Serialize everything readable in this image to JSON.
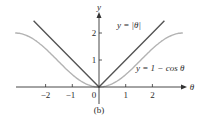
{
  "chart_data": {
    "type": "line",
    "title": "",
    "caption": "(b)",
    "xlabel": "θ",
    "ylabel": "y",
    "xlim": [
      -3.14,
      3.14
    ],
    "ylim": [
      0,
      2.4
    ],
    "x_ticks": [
      -2,
      -1,
      0,
      1,
      2
    ],
    "x_tick_labels": [
      "−2",
      "−1",
      "0",
      "1",
      "2"
    ],
    "y_ticks": [
      1,
      2
    ],
    "y_tick_labels": [
      "1",
      "2"
    ],
    "grid": false,
    "legend": "inline annotations",
    "series": [
      {
        "name": "y = |θ|",
        "color": "#555555",
        "x": [
          -2.45,
          -2,
          -1,
          0,
          1,
          2,
          2.45
        ],
        "values": [
          2.45,
          2,
          1,
          0,
          1,
          2,
          2.45
        ]
      },
      {
        "name": "y = 1 − cos θ",
        "color": "#b3b3b3",
        "x": [
          -3.14,
          -2.5,
          -2,
          -1.5,
          -1,
          -0.5,
          0,
          0.5,
          1,
          1.5,
          2,
          2.5,
          3.14
        ],
        "values": [
          2.0,
          1.8,
          1.42,
          0.93,
          0.46,
          0.12,
          0,
          0.12,
          0.46,
          0.93,
          1.42,
          1.8,
          2.0
        ]
      }
    ],
    "annotations": [
      {
        "text": "y = |θ|",
        "near": "upper right of |θ| line"
      },
      {
        "text": "y = 1 − cos θ",
        "near": "right of cosine curve"
      }
    ]
  },
  "labels": {
    "x_axis": "θ",
    "y_axis": "y",
    "tick_x_neg2": "−2",
    "tick_x_neg1": "−1",
    "tick_x_0": "0",
    "tick_x_1": "1",
    "tick_x_2": "2",
    "tick_y_1": "1",
    "tick_y_2": "2",
    "abs_label": "y = |θ|",
    "cos_label": "y = 1 − cos θ",
    "caption": "(b)"
  }
}
